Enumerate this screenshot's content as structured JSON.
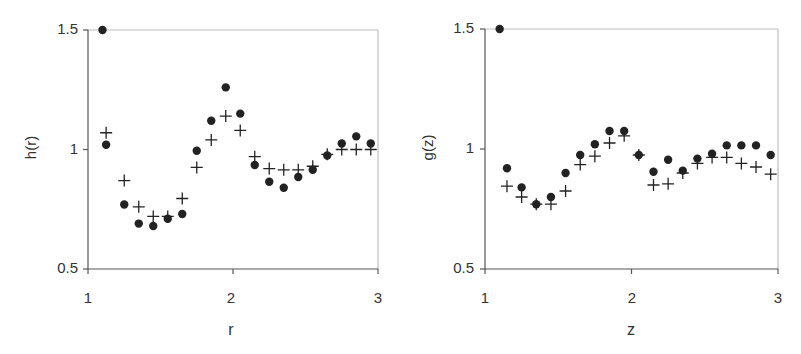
{
  "chart_data": [
    {
      "type": "scatter",
      "title": "",
      "xlabel": "r",
      "ylabel": "h(r)",
      "xlim": [
        1,
        3
      ],
      "ylim": [
        0.5,
        1.5
      ],
      "xticks": [
        "1",
        "2",
        "3"
      ],
      "yticks": [
        "0.5",
        "1",
        "1.5"
      ],
      "grid": false,
      "legend": null,
      "series": [
        {
          "name": "filled circles",
          "marker": "circle",
          "points": [
            [
              1.1,
              1.5
            ],
            [
              1.125,
              1.02
            ],
            [
              1.25,
              0.77
            ],
            [
              1.35,
              0.69
            ],
            [
              1.45,
              0.68
            ],
            [
              1.55,
              0.71
            ],
            [
              1.65,
              0.73
            ],
            [
              1.75,
              0.995
            ],
            [
              1.85,
              1.12
            ],
            [
              1.95,
              1.26
            ],
            [
              2.05,
              1.15
            ],
            [
              2.15,
              0.935
            ],
            [
              2.25,
              0.865
            ],
            [
              2.35,
              0.84
            ],
            [
              2.45,
              0.885
            ],
            [
              2.55,
              0.915
            ],
            [
              2.65,
              0.975
            ],
            [
              2.75,
              1.025
            ],
            [
              2.85,
              1.055
            ],
            [
              2.95,
              1.025
            ]
          ]
        },
        {
          "name": "crosses",
          "marker": "plus",
          "points": [
            [
              1.125,
              1.07
            ],
            [
              1.25,
              0.87
            ],
            [
              1.35,
              0.76
            ],
            [
              1.45,
              0.72
            ],
            [
              1.55,
              0.72
            ],
            [
              1.65,
              0.795
            ],
            [
              1.75,
              0.925
            ],
            [
              1.85,
              1.04
            ],
            [
              1.95,
              1.14
            ],
            [
              2.05,
              1.08
            ],
            [
              2.15,
              0.97
            ],
            [
              2.25,
              0.92
            ],
            [
              2.35,
              0.915
            ],
            [
              2.45,
              0.915
            ],
            [
              2.55,
              0.93
            ],
            [
              2.65,
              0.98
            ],
            [
              2.75,
              1.0
            ],
            [
              2.85,
              1.0
            ],
            [
              2.95,
              1.0
            ]
          ]
        }
      ]
    },
    {
      "type": "scatter",
      "title": "",
      "xlabel": "z",
      "ylabel": "g(z)",
      "xlim": [
        1,
        3
      ],
      "ylim": [
        0.5,
        1.5
      ],
      "xticks": [
        "1",
        "2",
        "3"
      ],
      "yticks": [
        "0.5",
        "1",
        "1.5"
      ],
      "grid": false,
      "legend": null,
      "series": [
        {
          "name": "filled circles",
          "marker": "circle",
          "points": [
            [
              1.1,
              1.5
            ],
            [
              1.15,
              0.92
            ],
            [
              1.25,
              0.84
            ],
            [
              1.35,
              0.77
            ],
            [
              1.45,
              0.8
            ],
            [
              1.55,
              0.9
            ],
            [
              1.65,
              0.975
            ],
            [
              1.75,
              1.02
            ],
            [
              1.85,
              1.075
            ],
            [
              1.95,
              1.075
            ],
            [
              2.05,
              0.975
            ],
            [
              2.15,
              0.905
            ],
            [
              2.25,
              0.955
            ],
            [
              2.35,
              0.91
            ],
            [
              2.45,
              0.96
            ],
            [
              2.55,
              0.98
            ],
            [
              2.65,
              1.015
            ],
            [
              2.75,
              1.015
            ],
            [
              2.85,
              1.015
            ],
            [
              2.95,
              0.975
            ]
          ]
        },
        {
          "name": "crosses",
          "marker": "plus",
          "points": [
            [
              1.15,
              0.845
            ],
            [
              1.25,
              0.8
            ],
            [
              1.35,
              0.77
            ],
            [
              1.45,
              0.77
            ],
            [
              1.55,
              0.825
            ],
            [
              1.65,
              0.935
            ],
            [
              1.75,
              0.97
            ],
            [
              1.85,
              1.025
            ],
            [
              1.95,
              1.055
            ],
            [
              2.05,
              0.975
            ],
            [
              2.15,
              0.85
            ],
            [
              2.25,
              0.855
            ],
            [
              2.35,
              0.9
            ],
            [
              2.45,
              0.94
            ],
            [
              2.55,
              0.965
            ],
            [
              2.65,
              0.965
            ],
            [
              2.75,
              0.94
            ],
            [
              2.85,
              0.925
            ],
            [
              2.95,
              0.895
            ]
          ]
        }
      ]
    }
  ],
  "panels": [
    {
      "xlabel": "r",
      "ylabel": "h(r)",
      "yticks": [
        "1.5",
        "1",
        "0.5"
      ],
      "xticks": [
        "1",
        "2",
        "3"
      ]
    },
    {
      "xlabel": "z",
      "ylabel": "g(z)",
      "yticks": [
        "1.5",
        "1",
        "0.5"
      ],
      "xticks": [
        "1",
        "2",
        "3"
      ]
    }
  ],
  "colors": {
    "axis": "#555555",
    "frame": "#bbbbbb",
    "marker": "#222222"
  }
}
